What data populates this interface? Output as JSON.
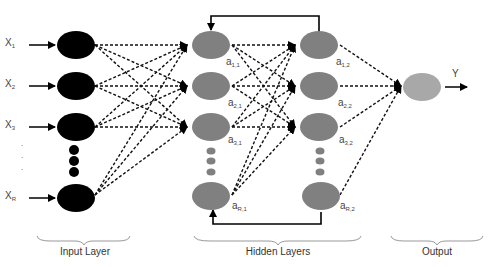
{
  "diagram": {
    "type": "recurrent neural network",
    "input_layer": {
      "label": "Input Layer",
      "nodes": [
        {
          "name": "X",
          "sub": "1"
        },
        {
          "name": "X",
          "sub": "2"
        },
        {
          "name": "X",
          "sub": "3"
        },
        {
          "name": "X",
          "sub": "R"
        }
      ],
      "node_color": "#000000"
    },
    "hidden_layers": {
      "label": "Hidden Layers",
      "layer1": [
        {
          "name": "a",
          "sub": "1,1"
        },
        {
          "name": "a",
          "sub": "2,1"
        },
        {
          "name": "a",
          "sub": "3,1"
        },
        {
          "name": "a",
          "sub": "R,1"
        }
      ],
      "layer2": [
        {
          "name": "a",
          "sub": "1,2"
        },
        {
          "name": "a",
          "sub": "2,2"
        },
        {
          "name": "a",
          "sub": "3,2"
        },
        {
          "name": "a",
          "sub": "R,2"
        }
      ],
      "node_color": "#808080"
    },
    "output_layer": {
      "label": "Output",
      "output_symbol": "Y",
      "node_color": "#a8a8a8"
    }
  }
}
